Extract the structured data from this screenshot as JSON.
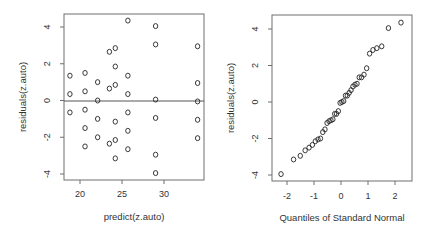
{
  "chart_data": [
    {
      "type": "scatter",
      "title": "",
      "xlabel": "predict(z.auto)",
      "ylabel": "residuals(z.auto)",
      "xlim": [
        18,
        35
      ],
      "ylim": [
        -4.2,
        4.8
      ],
      "xticks": [
        20,
        25,
        30
      ],
      "yticks": [
        -4,
        -2,
        0,
        2,
        4
      ],
      "reference_line": {
        "type": "horizontal",
        "y": 0
      },
      "grid": false,
      "points": [
        {
          "x": 18.8,
          "y": 1.35
        },
        {
          "x": 18.8,
          "y": 0.35
        },
        {
          "x": 18.8,
          "y": -0.65
        },
        {
          "x": 20.6,
          "y": 1.5
        },
        {
          "x": 20.6,
          "y": 0.5
        },
        {
          "x": 20.6,
          "y": -0.5
        },
        {
          "x": 20.6,
          "y": -1.5
        },
        {
          "x": 20.6,
          "y": -2.5
        },
        {
          "x": 22.1,
          "y": 1.0
        },
        {
          "x": 22.1,
          "y": 0.0
        },
        {
          "x": 22.1,
          "y": -1.0
        },
        {
          "x": 22.1,
          "y": -2.0
        },
        {
          "x": 23.5,
          "y": 2.65
        },
        {
          "x": 23.5,
          "y": 0.65
        },
        {
          "x": 23.5,
          "y": -2.35
        },
        {
          "x": 24.2,
          "y": 2.85
        },
        {
          "x": 24.2,
          "y": 1.85
        },
        {
          "x": 24.2,
          "y": 0.85
        },
        {
          "x": 24.2,
          "y": -1.15
        },
        {
          "x": 24.2,
          "y": -2.15
        },
        {
          "x": 24.2,
          "y": -3.15
        },
        {
          "x": 25.7,
          "y": 4.35
        },
        {
          "x": 25.7,
          "y": 1.35
        },
        {
          "x": 25.7,
          "y": 0.35
        },
        {
          "x": 25.7,
          "y": -0.65
        },
        {
          "x": 25.7,
          "y": -1.65
        },
        {
          "x": 25.7,
          "y": -2.65
        },
        {
          "x": 29.0,
          "y": 4.05
        },
        {
          "x": 29.0,
          "y": 3.05
        },
        {
          "x": 29.0,
          "y": 0.05
        },
        {
          "x": 29.0,
          "y": -0.95
        },
        {
          "x": 29.0,
          "y": -2.95
        },
        {
          "x": 29.0,
          "y": -3.95
        },
        {
          "x": 34.0,
          "y": 2.95
        },
        {
          "x": 34.0,
          "y": 0.95
        },
        {
          "x": 34.0,
          "y": -0.05
        },
        {
          "x": 34.0,
          "y": -1.05
        },
        {
          "x": 34.0,
          "y": -2.05
        }
      ]
    },
    {
      "type": "scatter",
      "subtype": "qq-normal",
      "title": "",
      "xlabel": "Quantiles of Standard Normal",
      "ylabel": "residuals(z.auto)",
      "xlim": [
        -2.55,
        2.55
      ],
      "ylim": [
        -4.2,
        4.8
      ],
      "xticks": [
        -2,
        -1,
        0,
        1,
        2
      ],
      "yticks": [
        -4,
        -2,
        0,
        2,
        4
      ],
      "grid": false,
      "sample_values_sorted": [
        -3.95,
        -3.15,
        -2.95,
        -2.65,
        -2.5,
        -2.35,
        -2.15,
        -2.05,
        -2.0,
        -1.65,
        -1.5,
        -1.15,
        -1.05,
        -1.0,
        -0.95,
        -0.65,
        -0.65,
        -0.5,
        -0.05,
        0.0,
        0.05,
        0.35,
        0.35,
        0.5,
        0.65,
        0.85,
        0.95,
        1.0,
        1.35,
        1.35,
        1.5,
        1.85,
        2.65,
        2.85,
        2.95,
        3.05,
        4.05,
        4.35
      ]
    }
  ]
}
